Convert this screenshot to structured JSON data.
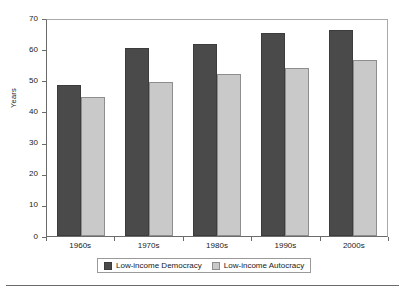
{
  "chart_data": {
    "type": "bar",
    "title": "",
    "xlabel": "",
    "ylabel": "Years",
    "ylim": [
      0,
      70
    ],
    "yticks": [
      0,
      10,
      20,
      30,
      40,
      50,
      60,
      70
    ],
    "ytick_labels": [
      "0",
      "10",
      "20",
      "30",
      "40",
      "50",
      "60",
      "70"
    ],
    "grid": false,
    "legend_position": "bottom",
    "categories": [
      "1960s",
      "1970s",
      "1980s",
      "1990s",
      "2000s"
    ],
    "series": [
      {
        "name": "Low-income Democracy",
        "color": "#4a4a4a",
        "values": [
          48.5,
          60.4,
          61.6,
          65.2,
          66.1
        ]
      },
      {
        "name": "Low-income Autocracy",
        "color": "#c9c9c9",
        "values": [
          44.7,
          49.4,
          52.0,
          53.9,
          56.5
        ]
      }
    ]
  },
  "colors": {
    "series_dark": "#4a4a4a",
    "series_light": "#c9c9c9",
    "axis": "#6b6b6b",
    "plot_border": "#a9a9a9",
    "background": "#ffffff"
  }
}
